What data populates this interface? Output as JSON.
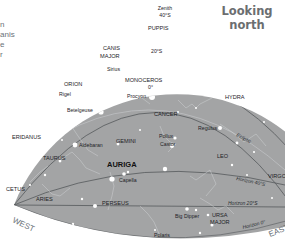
{
  "title": {
    "line1": "Looking",
    "line2": "north"
  },
  "side_text_fragments": [
    "n",
    "anis",
    "e",
    "r"
  ],
  "colors": {
    "sky": "#a3a4a5",
    "sky_edge": "#9c9d9e",
    "lines": "#55595c",
    "constellation_lines": "#cfd1d3",
    "stars": "#ffffff",
    "label_text": "#1e2226",
    "direction_text": "#6a7278"
  },
  "markers": {
    "zenith": {
      "label": "Zenith",
      "value": "40°S"
    },
    "dec_20s": "20°S",
    "dec_0": "0°"
  },
  "directions": {
    "west": "WEST",
    "east": "EAST"
  },
  "lines": {
    "ecliptic": "Ecliptic",
    "horizon_40": "Horizon 40°S",
    "horizon_20": "Horizon 20°S",
    "horizon_0": "Horizon 0°"
  },
  "constellations": [
    "PUPPIS",
    "CANIS",
    "MAJOR",
    "MONOCEROS",
    "ORION",
    "HYDRA",
    "CANCER",
    "ERIDANUS",
    "GEMINI",
    "TAURUS",
    "AURIGA",
    "LEO",
    "VIRGO",
    "CETUS",
    "ARIES",
    "PERSEUS",
    "URSA",
    "MAJOR"
  ],
  "stars": [
    "Sirius",
    "Procyon",
    "Rigel",
    "Betelgeuse",
    "Aldebaran",
    "Pollux",
    "Castor",
    "Regulus",
    "Capella",
    "Big Dipper",
    "Polaris"
  ]
}
